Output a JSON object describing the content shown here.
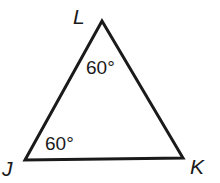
{
  "figure": {
    "type": "triangle",
    "vertices": [
      {
        "name": "L",
        "label": "L"
      },
      {
        "name": "J",
        "label": "J"
      },
      {
        "name": "K",
        "label": "K"
      }
    ],
    "angles": [
      {
        "vertex": "L",
        "label": "60°"
      },
      {
        "vertex": "J",
        "label": "60°"
      }
    ],
    "stroke_color": "#1a1a1a"
  }
}
